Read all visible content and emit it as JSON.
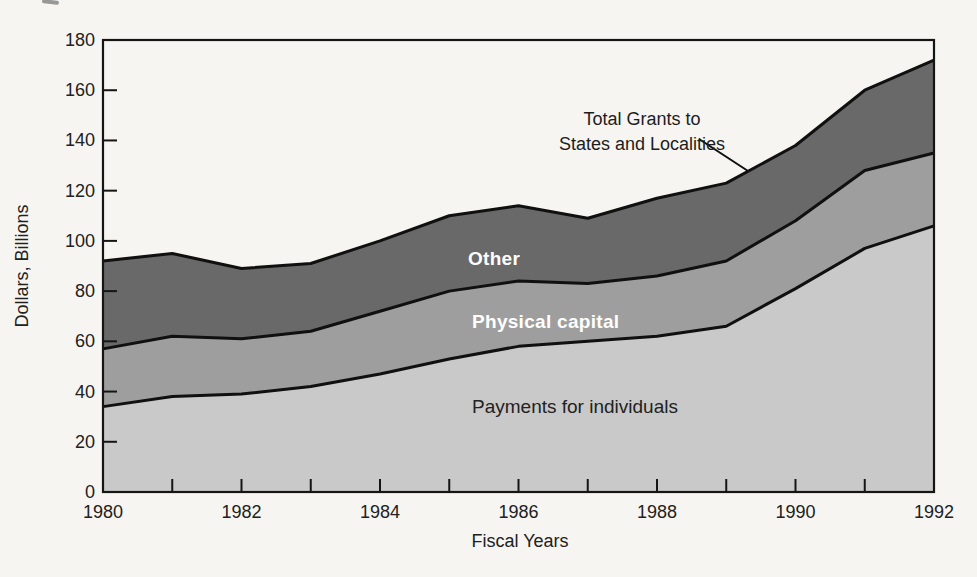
{
  "page": {
    "background": "#f6f5f1"
  },
  "y_axis": {
    "title": "Dollars, Billions",
    "tick_labels": [
      0,
      20,
      40,
      60,
      80,
      100,
      120,
      140,
      160,
      180
    ],
    "min": 0,
    "max": 180
  },
  "x_axis": {
    "title": "Fiscal Years",
    "tick_labels": [
      1980,
      1982,
      1984,
      1986,
      1988,
      1990,
      1992
    ]
  },
  "annotation": {
    "line1": "Total Grants to",
    "line2": "States and Localities"
  },
  "labels": {
    "other": "Other",
    "physical": "Physical capital",
    "payments": "Payments for individuals"
  },
  "colors": {
    "payments_fill": "#c9c9c9",
    "physical_fill": "#9e9e9e",
    "other_fill": "#696969",
    "boundary_line": "#101010",
    "frame": "#151515"
  },
  "chart_data": {
    "type": "area",
    "stacked": true,
    "title": "Total Grants to States and Localities",
    "xlabel": "Fiscal Years",
    "ylabel": "Dollars, Billions",
    "x": [
      1980,
      1981,
      1982,
      1983,
      1984,
      1985,
      1986,
      1987,
      1988,
      1989,
      1990,
      1991,
      1992
    ],
    "series": [
      {
        "name": "Payments for individuals",
        "values": [
          34,
          38,
          39,
          42,
          47,
          53,
          58,
          60,
          62,
          66,
          81,
          97,
          106
        ]
      },
      {
        "name": "Physical capital",
        "values": [
          23,
          24,
          22,
          22,
          25,
          27,
          26,
          23,
          24,
          26,
          27,
          31,
          29
        ]
      },
      {
        "name": "Other",
        "values": [
          35,
          33,
          28,
          27,
          28,
          30,
          30,
          26,
          31,
          31,
          30,
          32,
          37
        ]
      }
    ],
    "totals": [
      92,
      95,
      89,
      91,
      100,
      110,
      114,
      109,
      117,
      123,
      138,
      160,
      172
    ],
    "ylim": [
      0,
      180
    ],
    "xlim": [
      1980,
      1992
    ],
    "grid": false,
    "legend_position": "in-plot-labels"
  }
}
